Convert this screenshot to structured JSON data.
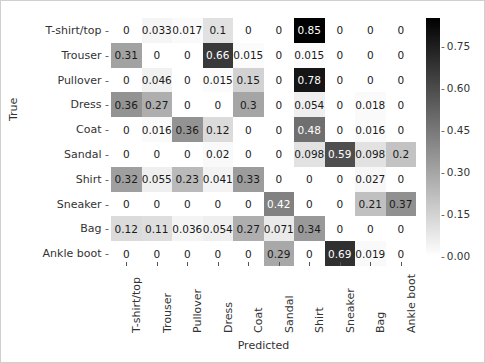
{
  "chart_data": {
    "type": "heatmap",
    "title": "",
    "xlabel": "Predicted",
    "ylabel": "True",
    "categories": [
      "T-shirt/top",
      "Trouser",
      "Pullover",
      "Dress",
      "Coat",
      "Sandal",
      "Shirt",
      "Sneaker",
      "Bag",
      "Ankle boot"
    ],
    "x_tick_labels": [
      "T-shirt/top",
      "Trouser",
      "Pullover",
      "Dress",
      "Coat",
      "Sandal",
      "Shirt",
      "Sneaker",
      "Bag",
      "Ankle boot"
    ],
    "y_tick_labels": [
      "T-shirt/top",
      "Trouser",
      "Pullover",
      "Dress",
      "Coat",
      "Sandal",
      "Shirt",
      "Sneaker",
      "Bag",
      "Ankle boot"
    ],
    "colormap": "Greys",
    "grid": false,
    "colorbar": {
      "ticks": [
        "0.00",
        "0.15",
        "0.30",
        "0.45",
        "0.60",
        "0.75"
      ],
      "tick_values": [
        0.0,
        0.15,
        0.3,
        0.45,
        0.6,
        0.75
      ],
      "vmin": 0.0,
      "vmax": 0.85,
      "low_color": "#ffffff",
      "high_color": "#000000"
    },
    "annotation_text_color_dark": "#1a1a1a",
    "annotation_text_color_light": "#ffffff",
    "values": [
      [
        0,
        0.033,
        0.017,
        0.1,
        0,
        0,
        0.85,
        0,
        0,
        0
      ],
      [
        0.31,
        0,
        0,
        0.66,
        0.015,
        0,
        0.015,
        0,
        0,
        0
      ],
      [
        0,
        0.046,
        0,
        0.015,
        0.15,
        0,
        0.78,
        0,
        0,
        0
      ],
      [
        0.36,
        0.27,
        0,
        0,
        0.3,
        0,
        0.054,
        0,
        0.018,
        0
      ],
      [
        0,
        0.016,
        0.36,
        0.12,
        0,
        0,
        0.48,
        0,
        0.016,
        0
      ],
      [
        0,
        0,
        0,
        0.02,
        0,
        0,
        0.098,
        0.59,
        0.098,
        0.2
      ],
      [
        0.32,
        0.055,
        0.23,
        0.041,
        0.33,
        0,
        0,
        0,
        0.027,
        0
      ],
      [
        0,
        0,
        0,
        0,
        0,
        0.42,
        0,
        0,
        0.21,
        0.37
      ],
      [
        0.12,
        0.11,
        0.036,
        0.054,
        0.27,
        0.071,
        0.34,
        0,
        0,
        0
      ],
      [
        0,
        0,
        0,
        0,
        0,
        0.29,
        0,
        0.69,
        0.019,
        0
      ]
    ],
    "labels": [
      [
        "0",
        "0.033",
        "0.017",
        "0.1",
        "0",
        "0",
        "0.85",
        "0",
        "0",
        "0"
      ],
      [
        "0.31",
        "0",
        "0",
        "0.66",
        "0.015",
        "0",
        "0.015",
        "0",
        "0",
        "0"
      ],
      [
        "0",
        "0.046",
        "0",
        "0.015",
        "0.15",
        "0",
        "0.78",
        "0",
        "0",
        "0"
      ],
      [
        "0.36",
        "0.27",
        "0",
        "0",
        "0.3",
        "0",
        "0.054",
        "0",
        "0.018",
        "0"
      ],
      [
        "0",
        "0.016",
        "0.36",
        "0.12",
        "0",
        "0",
        "0.48",
        "0",
        "0.016",
        "0"
      ],
      [
        "0",
        "0",
        "0",
        "0.02",
        "0",
        "0",
        "0.098",
        "0.59",
        "0.098",
        "0.2"
      ],
      [
        "0.32",
        "0.055",
        "0.23",
        "0.041",
        "0.33",
        "0",
        "0",
        "0",
        "0.027",
        "0"
      ],
      [
        "0",
        "0",
        "0",
        "0",
        "0",
        "0.42",
        "0",
        "0",
        "0.21",
        "0.37"
      ],
      [
        "0.12",
        "0.11",
        "0.036",
        "0.054",
        "0.27",
        "0.071",
        "0.34",
        "0",
        "0",
        "0"
      ],
      [
        "0",
        "0",
        "0",
        "0",
        "0",
        "0.29",
        "0",
        "0.69",
        "0.019",
        "0"
      ]
    ]
  }
}
